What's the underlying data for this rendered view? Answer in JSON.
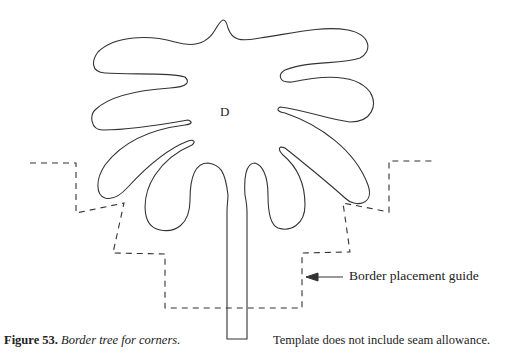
{
  "figure": {
    "template_label": "D",
    "guide_label": "Border placement guide",
    "caption_number": "Figure 53.",
    "caption_text": "Border tree for corners.",
    "note": "Template does not include seam allowance."
  },
  "colors": {
    "line": "#333333",
    "background": "#ffffff"
  }
}
